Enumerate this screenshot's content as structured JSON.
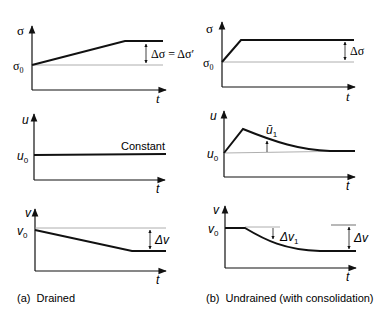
{
  "panels": {
    "a": {
      "caption": "(a)  Drained",
      "stress": {
        "axis_label": "σ",
        "origin_label": "σ",
        "origin_sub": "0",
        "delta_label": "Δσ = Δσ′",
        "t_label": "t"
      },
      "pore": {
        "axis_label": "u",
        "origin_label": "u",
        "origin_sub": "0",
        "note": "Constant",
        "t_label": "t"
      },
      "volume": {
        "axis_label": "v",
        "origin_label": "v",
        "origin_sub": "0",
        "delta_label": "Δv",
        "t_label": "t"
      }
    },
    "b": {
      "caption": "(b)  Undrained (with consolidation)",
      "stress": {
        "axis_label": "σ",
        "origin_label": "σ",
        "origin_sub": "0",
        "delta_label": "Δσ",
        "t_label": "t"
      },
      "pore": {
        "axis_label": "u",
        "origin_label": "u",
        "origin_sub": "0",
        "peak_label": "ū",
        "peak_sub": "1",
        "t_label": "t"
      },
      "volume": {
        "axis_label": "v",
        "origin_label": "v",
        "origin_sub": "0",
        "delta1_label": "Δv",
        "delta1_sub": "1",
        "delta_label": "Δv",
        "t_label": "t"
      }
    }
  },
  "colors": {
    "ink": "#111111",
    "thin": "#9a9a9a"
  }
}
